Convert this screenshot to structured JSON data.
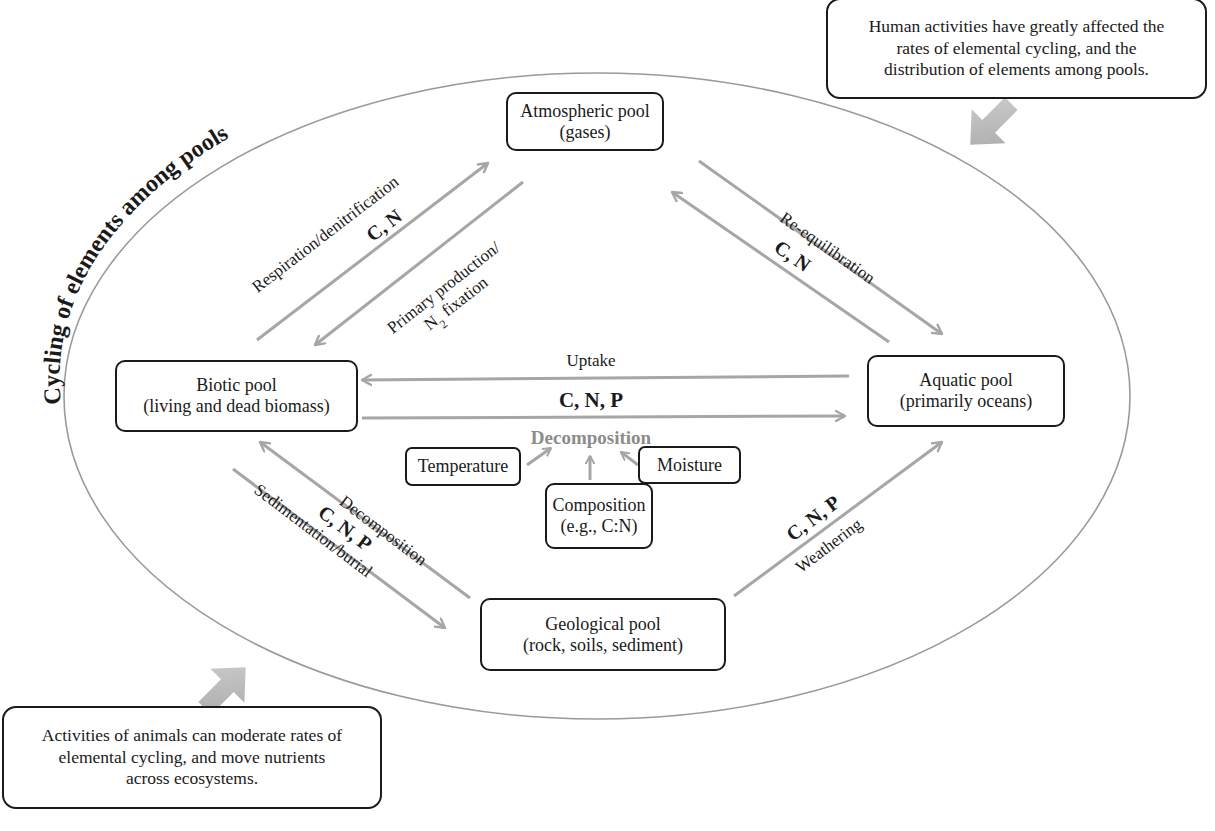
{
  "diagram": {
    "title": "Cycling of elements among pools",
    "colors": {
      "arrow": "#a6a6a6",
      "ellipse": "#9a9a9a",
      "box_border": "#1a1a1a",
      "decomposition_center": "#8c8c8c",
      "callout_arrow": "#b5b5b5"
    },
    "pools": {
      "atmospheric": {
        "name": "Atmospheric pool",
        "detail": "(gases)"
      },
      "biotic": {
        "name": "Biotic pool",
        "detail": "(living and dead biomass)"
      },
      "aquatic": {
        "name": "Aquatic pool",
        "detail": "(primarily oceans)"
      },
      "geological": {
        "name": "Geological pool",
        "detail": "(rock, soils, sediment)"
      }
    },
    "flows": {
      "respiration": {
        "label": "Respiration/denitrification",
        "elements": "C, N",
        "from": "biotic",
        "to": "atmospheric"
      },
      "primary_production": {
        "label_line1": "Primary production/",
        "label_line2_main": "N",
        "label_line2_sub": "2",
        "label_line2_rest": " fixation",
        "from": "atmospheric",
        "to": "biotic"
      },
      "re_equilibration": {
        "label": "Re-equilibration",
        "elements": "C, N",
        "between": [
          "atmospheric",
          "aquatic"
        ]
      },
      "uptake": {
        "label": "Uptake",
        "from": "aquatic",
        "to": "biotic"
      },
      "biotic_to_aquatic": {
        "elements": "C, N, P",
        "from": "biotic",
        "to": "aquatic"
      },
      "decomposition_geo": {
        "label": "Decomposition",
        "elements": "C, N, P",
        "from": "geological",
        "to": "biotic"
      },
      "sedimentation": {
        "label": "Sedimentation/burial",
        "from": "biotic",
        "to": "geological"
      },
      "weathering": {
        "label": "Weathering",
        "elements": "C, N, P",
        "from": "geological",
        "to": "aquatic"
      }
    },
    "decomposition_center": {
      "label": "Decomposition",
      "factors": {
        "temperature": "Temperature",
        "moisture": "Moisture",
        "composition_line1": "Composition",
        "composition_line2": "(e.g., C:N)"
      }
    },
    "callouts": {
      "human": {
        "line1": "Human activities have greatly affected the",
        "line2": "rates of elemental cycling, and the",
        "line3": "distribution of elements among pools."
      },
      "animals": {
        "line1": "Activities of animals can moderate rates of",
        "line2": "elemental cycling, and move nutrients",
        "line3": "across ecosystems."
      }
    }
  }
}
